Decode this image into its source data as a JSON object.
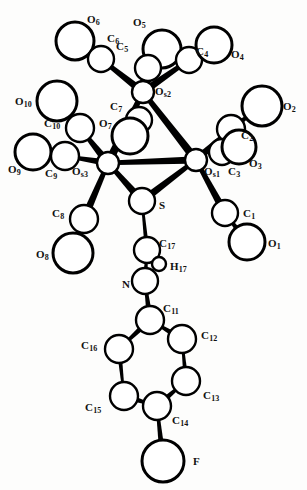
{
  "figure": {
    "kind": "molecular-structure-ortep-diagram",
    "compound_description": "Triosmium cluster with bridging thiolate-imine ligand bearing a 4-fluorophenyl group",
    "background_color": "#fdfdfc",
    "line_color": "#000000",
    "label_color": "#111111",
    "width": 307,
    "height": 490
  },
  "atoms": [
    {
      "id": "O6",
      "element": "O",
      "index": "6",
      "cx": 75,
      "cy": 41,
      "r": 19,
      "style": "open",
      "label": "O",
      "sub": "6",
      "lx": 87,
      "ly": 14
    },
    {
      "id": "C6",
      "element": "C",
      "index": "6",
      "cx": 101,
      "cy": 59,
      "r": 13,
      "style": "open",
      "label": "C",
      "sub": "6",
      "lx": 107,
      "ly": 33
    },
    {
      "id": "O5",
      "element": "O",
      "index": "5",
      "cx": 162,
      "cy": 49,
      "r": 19,
      "style": "open",
      "label": "O",
      "sub": "5",
      "lx": 133,
      "ly": 17
    },
    {
      "id": "C5",
      "element": "C",
      "index": "5",
      "cx": 148,
      "cy": 68,
      "r": 13,
      "style": "open",
      "label": "C",
      "sub": "5",
      "lx": 116,
      "ly": 41
    },
    {
      "id": "C4",
      "element": "C",
      "index": "4",
      "cx": 189,
      "cy": 60,
      "r": 13,
      "style": "open",
      "label": "C",
      "sub": "4",
      "lx": 196,
      "ly": 46
    },
    {
      "id": "O4",
      "element": "O",
      "index": "4",
      "cx": 214,
      "cy": 45,
      "r": 18,
      "style": "open",
      "label": "O",
      "sub": "4",
      "lx": 231,
      "ly": 49
    },
    {
      "id": "Os2",
      "element": "Os",
      "index": "2",
      "cx": 143,
      "cy": 92,
      "r": 11,
      "style": "open",
      "label": "O",
      "sub": "s2",
      "lx": 155,
      "ly": 86
    },
    {
      "id": "O10",
      "element": "O",
      "index": "10",
      "cx": 57,
      "cy": 101,
      "r": 20,
      "style": "open",
      "label": "O",
      "sub": "10",
      "lx": 15,
      "ly": 96
    },
    {
      "id": "C10",
      "element": "C",
      "index": "10",
      "cx": 80,
      "cy": 128,
      "r": 14,
      "style": "open",
      "label": "C",
      "sub": "10",
      "lx": 44,
      "ly": 118
    },
    {
      "id": "C7",
      "element": "C",
      "index": "7",
      "cx": 139,
      "cy": 120,
      "r": 13,
      "style": "open",
      "label": "C",
      "sub": "7",
      "lx": 110,
      "ly": 101
    },
    {
      "id": "O7",
      "element": "O",
      "index": "7",
      "cx": 130,
      "cy": 136,
      "r": 18,
      "style": "open",
      "label": "O",
      "sub": "7",
      "lx": 99,
      "ly": 118
    },
    {
      "id": "C2",
      "element": "C",
      "index": "2",
      "cx": 231,
      "cy": 129,
      "r": 14,
      "style": "open",
      "label": "C",
      "sub": "2",
      "lx": 241,
      "ly": 130
    },
    {
      "id": "O2",
      "element": "O",
      "index": "2",
      "cx": 262,
      "cy": 106,
      "r": 20,
      "style": "open",
      "label": "O",
      "sub": "2",
      "lx": 283,
      "ly": 101
    },
    {
      "id": "O9",
      "element": "O",
      "index": "9",
      "cx": 33,
      "cy": 152,
      "r": 18,
      "style": "open",
      "label": "O",
      "sub": "9",
      "lx": 8,
      "ly": 164
    },
    {
      "id": "C9",
      "element": "C",
      "index": "9",
      "cx": 65,
      "cy": 156,
      "r": 14,
      "style": "open",
      "label": "C",
      "sub": "9",
      "lx": 45,
      "ly": 168
    },
    {
      "id": "Os3",
      "element": "Os",
      "index": "3",
      "cx": 108,
      "cy": 163,
      "r": 11,
      "style": "open",
      "label": "O",
      "sub": "s3",
      "lx": 72,
      "ly": 166
    },
    {
      "id": "Os1",
      "element": "Os",
      "index": "1",
      "cx": 196,
      "cy": 160,
      "r": 11,
      "style": "open",
      "label": "O",
      "sub": "s1",
      "lx": 204,
      "ly": 166
    },
    {
      "id": "C3",
      "element": "C",
      "index": "3",
      "cx": 222,
      "cy": 152,
      "r": 13,
      "style": "open",
      "label": "C",
      "sub": "3",
      "lx": 228,
      "ly": 166
    },
    {
      "id": "O3",
      "element": "O",
      "index": "3",
      "cx": 239,
      "cy": 147,
      "r": 17,
      "style": "open",
      "label": "O",
      "sub": "3",
      "lx": 249,
      "ly": 158
    },
    {
      "id": "C8",
      "element": "C",
      "index": "8",
      "cx": 84,
      "cy": 219,
      "r": 14,
      "style": "open",
      "label": "C",
      "sub": "8",
      "lx": 52,
      "ly": 208
    },
    {
      "id": "O8",
      "element": "O",
      "index": "8",
      "cx": 73,
      "cy": 253,
      "r": 20,
      "style": "open",
      "label": "O",
      "sub": "8",
      "lx": 36,
      "ly": 249
    },
    {
      "id": "S",
      "element": "S",
      "index": "",
      "cx": 142,
      "cy": 201,
      "r": 13,
      "style": "open",
      "label": "S",
      "sub": "",
      "lx": 159,
      "ly": 200
    },
    {
      "id": "C1",
      "element": "C",
      "index": "1",
      "cx": 225,
      "cy": 213,
      "r": 13,
      "style": "open",
      "label": "C",
      "sub": "1",
      "lx": 243,
      "ly": 208
    },
    {
      "id": "O1",
      "element": "O",
      "index": "1",
      "cx": 247,
      "cy": 242,
      "r": 18,
      "style": "open",
      "label": "O",
      "sub": "1",
      "lx": 268,
      "ly": 238
    },
    {
      "id": "C17",
      "element": "C",
      "index": "17",
      "cx": 147,
      "cy": 250,
      "r": 13,
      "style": "open",
      "label": "C",
      "sub": "17",
      "lx": 159,
      "ly": 238
    },
    {
      "id": "H17",
      "element": "H",
      "index": "17",
      "cx": 159,
      "cy": 264,
      "r": 7,
      "style": "open",
      "label": "H",
      "sub": "17",
      "lx": 170,
      "ly": 261
    },
    {
      "id": "N",
      "element": "N",
      "index": "",
      "cx": 145,
      "cy": 281,
      "r": 13,
      "style": "open",
      "label": "N",
      "sub": "",
      "lx": 122,
      "ly": 279
    },
    {
      "id": "C11",
      "element": "C",
      "index": "11",
      "cx": 150,
      "cy": 320,
      "r": 14,
      "style": "open",
      "label": "C",
      "sub": "11",
      "lx": 163,
      "ly": 303
    },
    {
      "id": "C12",
      "element": "C",
      "index": "12",
      "cx": 182,
      "cy": 339,
      "r": 14,
      "style": "open",
      "label": "C",
      "sub": "12",
      "lx": 201,
      "ly": 330
    },
    {
      "id": "C16",
      "element": "C",
      "index": "16",
      "cx": 119,
      "cy": 349,
      "r": 14,
      "style": "open",
      "label": "C",
      "sub": "16",
      "lx": 81,
      "ly": 340
    },
    {
      "id": "C13",
      "element": "C",
      "index": "13",
      "cx": 186,
      "cy": 381,
      "r": 14,
      "style": "open",
      "label": "C",
      "sub": "13",
      "lx": 203,
      "ly": 390
    },
    {
      "id": "C15",
      "element": "C",
      "index": "15",
      "cx": 124,
      "cy": 396,
      "r": 14,
      "style": "open",
      "label": "C",
      "sub": "15",
      "lx": 85,
      "ly": 402
    },
    {
      "id": "C14",
      "element": "C",
      "index": "14",
      "cx": 157,
      "cy": 406,
      "r": 14,
      "style": "open",
      "label": "C",
      "sub": "14",
      "lx": 172,
      "ly": 415
    },
    {
      "id": "F",
      "element": "F",
      "index": "",
      "cx": 163,
      "cy": 461,
      "r": 21,
      "style": "open",
      "label": "F",
      "sub": "",
      "lx": 193,
      "ly": 456
    }
  ],
  "bonds": [
    {
      "from": "O6",
      "to": "C6",
      "width": 5,
      "kind": "tapered"
    },
    {
      "from": "C6",
      "to": "Os2",
      "width": 7,
      "kind": "tapered"
    },
    {
      "from": "O5",
      "to": "C5",
      "width": 5,
      "kind": "tapered"
    },
    {
      "from": "C5",
      "to": "Os2",
      "width": 6,
      "kind": "tapered"
    },
    {
      "from": "O4",
      "to": "C4",
      "width": 5,
      "kind": "tapered"
    },
    {
      "from": "C4",
      "to": "Os2",
      "width": 7,
      "kind": "tapered"
    },
    {
      "from": "Os2",
      "to": "Os3",
      "width": 8,
      "kind": "metal-metal"
    },
    {
      "from": "Os2",
      "to": "Os1",
      "width": 8,
      "kind": "metal-metal"
    },
    {
      "from": "Os3",
      "to": "Os1",
      "width": 7,
      "kind": "metal-metal"
    },
    {
      "from": "O10",
      "to": "C10",
      "width": 5,
      "kind": "tapered"
    },
    {
      "from": "C10",
      "to": "Os3",
      "width": 7,
      "kind": "tapered"
    },
    {
      "from": "O9",
      "to": "C9",
      "width": 5,
      "kind": "tapered"
    },
    {
      "from": "C9",
      "to": "Os3",
      "width": 6,
      "kind": "tapered"
    },
    {
      "from": "Os3",
      "to": "C8",
      "width": 7,
      "kind": "tapered"
    },
    {
      "from": "C8",
      "to": "O8",
      "width": 5,
      "kind": "tapered"
    },
    {
      "from": "O2",
      "to": "C2",
      "width": 5,
      "kind": "tapered"
    },
    {
      "from": "C2",
      "to": "Os1",
      "width": 7,
      "kind": "tapered"
    },
    {
      "from": "Os1",
      "to": "C1",
      "width": 7,
      "kind": "tapered"
    },
    {
      "from": "C1",
      "to": "O1",
      "width": 5,
      "kind": "tapered"
    },
    {
      "from": "Os3",
      "to": "S",
      "width": 7,
      "kind": "tapered"
    },
    {
      "from": "Os1",
      "to": "S",
      "width": 7,
      "kind": "tapered"
    },
    {
      "from": "S",
      "to": "C17",
      "width": 4,
      "kind": "tapered"
    },
    {
      "from": "C17",
      "to": "N",
      "width": 4,
      "kind": "double-imine"
    },
    {
      "from": "N",
      "to": "C11",
      "width": 5,
      "kind": "tapered"
    },
    {
      "from": "C11",
      "to": "C12",
      "width": 5,
      "kind": "aromatic"
    },
    {
      "from": "C12",
      "to": "C13",
      "width": 4,
      "kind": "aromatic"
    },
    {
      "from": "C13",
      "to": "C14",
      "width": 5,
      "kind": "aromatic"
    },
    {
      "from": "C14",
      "to": "C15",
      "width": 5,
      "kind": "aromatic"
    },
    {
      "from": "C15",
      "to": "C16",
      "width": 4,
      "kind": "aromatic"
    },
    {
      "from": "C16",
      "to": "C11",
      "width": 5,
      "kind": "aromatic"
    },
    {
      "from": "C14",
      "to": "F",
      "width": 5,
      "kind": "tapered"
    }
  ]
}
